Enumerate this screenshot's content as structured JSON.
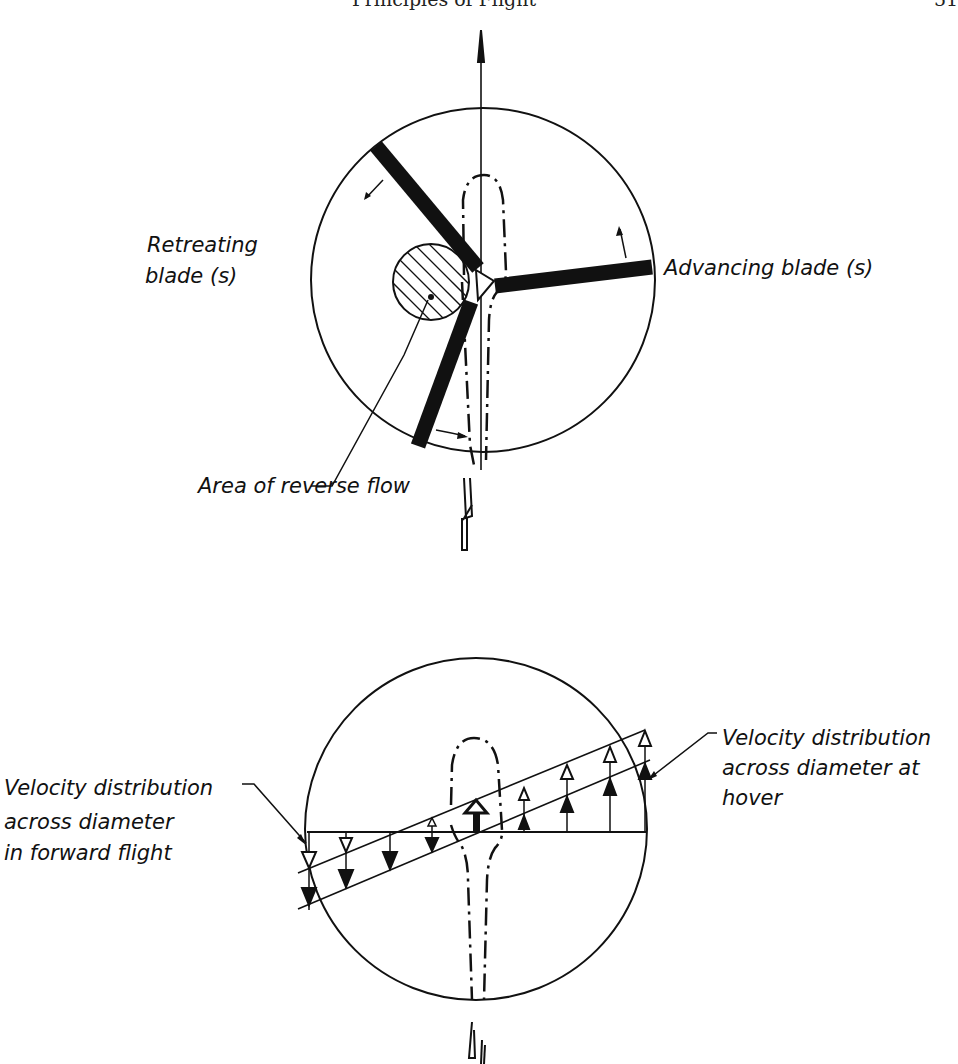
{
  "header": {
    "title": "Principles of Flight",
    "page_number": "51"
  },
  "top_diagram": {
    "labels": {
      "retreating_line1": "Retreating",
      "retreating_line2": "blade (s)",
      "advancing": "Advancing blade (s)",
      "reverse_flow": "Area of reverse flow"
    }
  },
  "bottom_diagram": {
    "labels": {
      "forward_line1": "Velocity distribution",
      "forward_line2": "across diameter",
      "forward_line3": "in forward flight",
      "hover_line1": "Velocity distribution",
      "hover_line2": "across diameter at",
      "hover_line3": "hover"
    }
  },
  "colors": {
    "ink": "#111111",
    "paper": "#ffffff"
  }
}
